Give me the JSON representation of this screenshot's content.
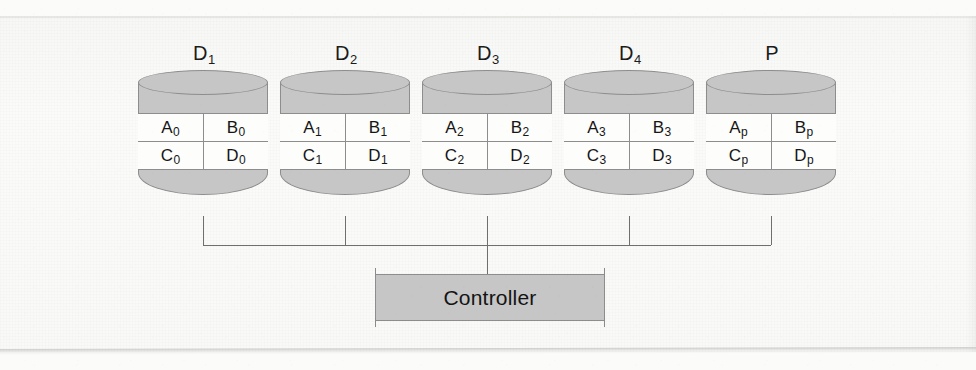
{
  "figure": {
    "disks": [
      {
        "id": "disk-d1",
        "label_base": "D",
        "label_sub": "1",
        "x": 138,
        "cells": [
          {
            "base": "A",
            "sub": "0"
          },
          {
            "base": "B",
            "sub": "0"
          },
          {
            "base": "C",
            "sub": "0"
          },
          {
            "base": "D",
            "sub": "0"
          }
        ]
      },
      {
        "id": "disk-d2",
        "label_base": "D",
        "label_sub": "2",
        "x": 280,
        "cells": [
          {
            "base": "A",
            "sub": "1"
          },
          {
            "base": "B",
            "sub": "1"
          },
          {
            "base": "C",
            "sub": "1"
          },
          {
            "base": "D",
            "sub": "1"
          }
        ]
      },
      {
        "id": "disk-d3",
        "label_base": "D",
        "label_sub": "3",
        "x": 422,
        "cells": [
          {
            "base": "A",
            "sub": "2"
          },
          {
            "base": "B",
            "sub": "2"
          },
          {
            "base": "C",
            "sub": "2"
          },
          {
            "base": "D",
            "sub": "2"
          }
        ]
      },
      {
        "id": "disk-d4",
        "label_base": "D",
        "label_sub": "4",
        "x": 564,
        "cells": [
          {
            "base": "A",
            "sub": "3"
          },
          {
            "base": "B",
            "sub": "3"
          },
          {
            "base": "C",
            "sub": "3"
          },
          {
            "base": "D",
            "sub": "3"
          }
        ]
      },
      {
        "id": "disk-p",
        "label_base": "P",
        "label_sub": "",
        "x": 706,
        "cells": [
          {
            "base": "A",
            "sub": "p"
          },
          {
            "base": "B",
            "sub": "p"
          },
          {
            "base": "C",
            "sub": "p"
          },
          {
            "base": "D",
            "sub": "p"
          }
        ]
      }
    ],
    "controller": {
      "label": "Controller"
    },
    "bus": {
      "drop_x": [
        203,
        345,
        487,
        629,
        771
      ],
      "bus_y": 245,
      "drop_top_y": 216,
      "controller_stem_x": 487,
      "controller_stem_top_y": 245,
      "controller_stem_bottom_y": 274
    },
    "colors": {
      "fill_gray": "#c6c6c6",
      "stroke_gray": "#8d8d8d",
      "wire_gray": "#6f6f6f",
      "cell_white": "#fdfdfc",
      "text_black": "#161616",
      "paper": "#f8f8f6"
    }
  }
}
